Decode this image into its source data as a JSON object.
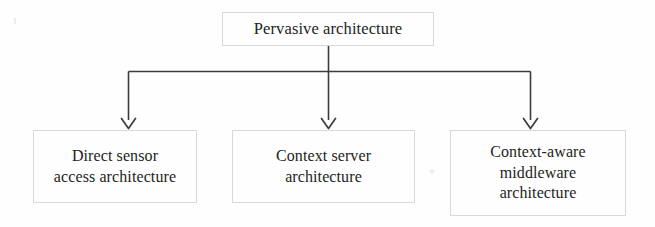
{
  "diagram": {
    "type": "tree-hierarchy",
    "title": "Pervasive architecture",
    "orientation": "top-down",
    "colors": {
      "background": "#fefefe",
      "box_border": "#d9d9d9",
      "connector": "#3c3c3c",
      "text": "#231f20"
    },
    "root": {
      "id": "pervasive-architecture",
      "label": "Pervasive architecture"
    },
    "children": [
      {
        "id": "direct-sensor-access-architecture",
        "label": "Direct sensor\naccess architecture"
      },
      {
        "id": "context-server-architecture",
        "label": "Context server\narchitecture"
      },
      {
        "id": "context-aware-middleware-architecture",
        "label": "Context-aware\nmiddleware\narchitecture"
      }
    ],
    "connectors": {
      "bus_label": "horizontal-distribution-bus",
      "arrow_count": 3,
      "arrow_style": "open-v-arrowhead"
    }
  }
}
